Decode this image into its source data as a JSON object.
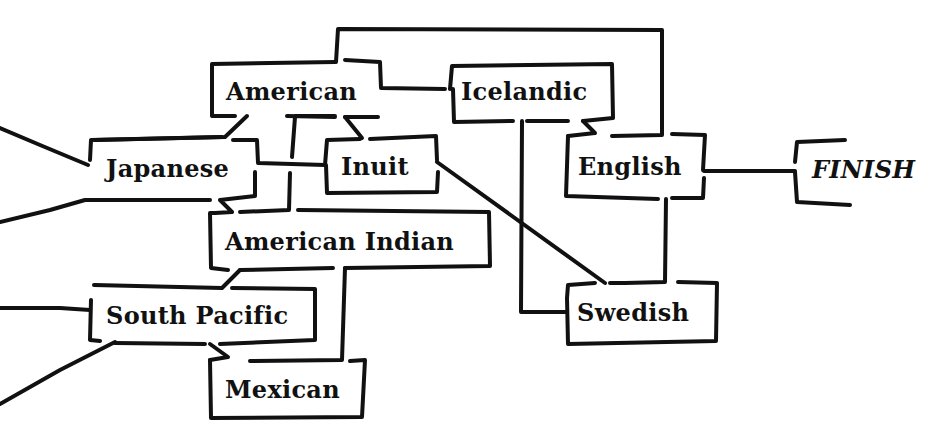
{
  "diagram": {
    "type": "flowchart",
    "style": "hand-drawn boxes with connecting lines",
    "stroke_color": "#111111",
    "background_color": "#ffffff",
    "nodes": [
      {
        "id": "american",
        "label": "American"
      },
      {
        "id": "icelandic",
        "label": "Icelandic"
      },
      {
        "id": "japanese",
        "label": "Japanese"
      },
      {
        "id": "inuit",
        "label": "Inuit"
      },
      {
        "id": "english",
        "label": "English"
      },
      {
        "id": "finish",
        "label": "FINISH"
      },
      {
        "id": "american_indian",
        "label": "American Indian"
      },
      {
        "id": "south_pacific",
        "label": "South Pacific"
      },
      {
        "id": "swedish",
        "label": "Swedish"
      },
      {
        "id": "mexican",
        "label": "Mexican"
      }
    ],
    "edges": [
      {
        "from": "offscreen-left",
        "to": "japanese"
      },
      {
        "from": "offscreen-left",
        "to": "japanese"
      },
      {
        "from": "offscreen-left",
        "to": "south_pacific"
      },
      {
        "from": "offscreen-left",
        "to": "south_pacific"
      },
      {
        "from": "american",
        "to": "icelandic"
      },
      {
        "from": "american",
        "to": "english"
      },
      {
        "from": "american",
        "to": "japanese"
      },
      {
        "from": "american",
        "to": "inuit"
      },
      {
        "from": "american",
        "to": "american_indian"
      },
      {
        "from": "japanese",
        "to": "inuit"
      },
      {
        "from": "japanese",
        "to": "american_indian"
      },
      {
        "from": "icelandic",
        "to": "english"
      },
      {
        "from": "icelandic",
        "to": "swedish"
      },
      {
        "from": "inuit",
        "to": "swedish"
      },
      {
        "from": "english",
        "to": "swedish"
      },
      {
        "from": "english",
        "to": "finish"
      },
      {
        "from": "american_indian",
        "to": "south_pacific"
      },
      {
        "from": "american_indian",
        "to": "mexican"
      },
      {
        "from": "south_pacific",
        "to": "mexican"
      }
    ]
  }
}
